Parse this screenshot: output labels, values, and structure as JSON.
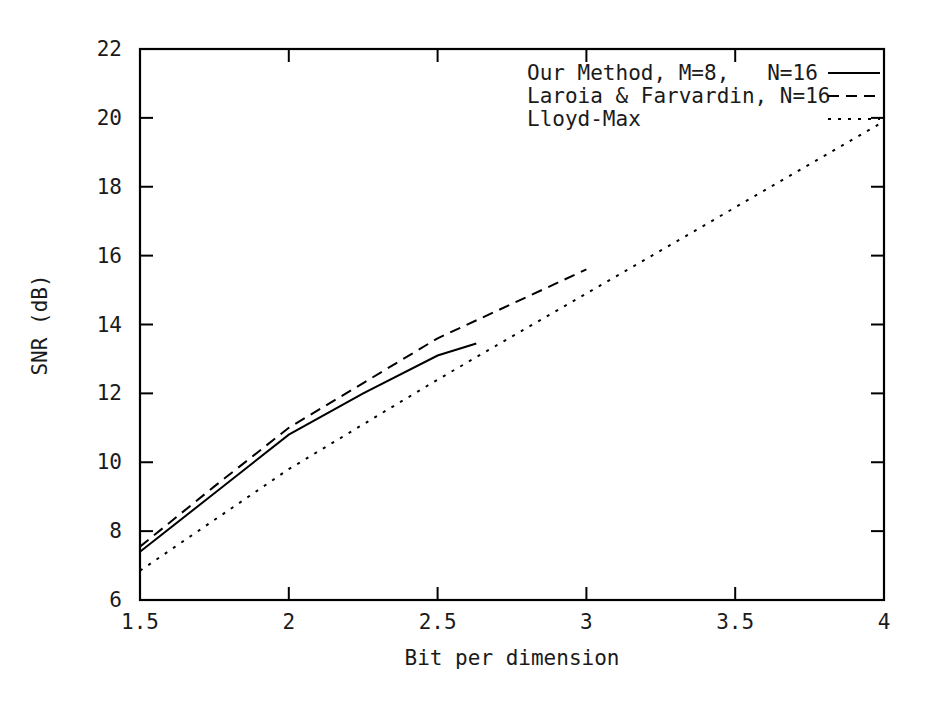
{
  "chart_data": {
    "type": "line",
    "title": "",
    "xlabel": "Bit per dimension",
    "ylabel": "SNR (dB)",
    "xlim": [
      1.5,
      4
    ],
    "ylim": [
      6,
      22
    ],
    "xticks": [
      "1.5",
      "2",
      "2.5",
      "3",
      "3.5",
      "4"
    ],
    "xtick_values": [
      1.5,
      2,
      2.5,
      3,
      3.5,
      4
    ],
    "yticks": [
      "6",
      "8",
      "10",
      "12",
      "14",
      "16",
      "18",
      "20",
      "22"
    ],
    "ytick_values": [
      6,
      8,
      10,
      12,
      14,
      16,
      18,
      20,
      22
    ],
    "grid": false,
    "legend_position": "top-right-inside",
    "series": [
      {
        "name": "Our Method, M=8,   N=16",
        "style": "solid",
        "x": [
          1.5,
          1.75,
          2.0,
          2.25,
          2.5,
          2.63
        ],
        "y": [
          7.4,
          9.1,
          10.8,
          12.0,
          13.1,
          13.45
        ]
      },
      {
        "name": "Laroia & Farvardin, N=16",
        "style": "dashed",
        "x": [
          1.5,
          1.75,
          2.0,
          2.25,
          2.5,
          2.75,
          3.0
        ],
        "y": [
          7.55,
          9.3,
          11.0,
          12.3,
          13.6,
          14.6,
          15.6
        ]
      },
      {
        "name": "Lloyd-Max",
        "style": "dotted",
        "x": [
          1.5,
          2.0,
          2.5,
          3.0,
          3.5,
          4.0
        ],
        "y": [
          6.85,
          9.8,
          12.4,
          14.9,
          17.4,
          19.9
        ]
      }
    ]
  },
  "legend": {
    "entries": [
      {
        "label": "Our Method, M=8,   N=16",
        "style": "solid"
      },
      {
        "label": "Laroia & Farvardin, N=16",
        "style": "dashed"
      },
      {
        "label": "Lloyd-Max",
        "style": "dotted"
      }
    ]
  },
  "axes": {
    "x_title": "Bit per dimension",
    "y_title": "SNR (dB)"
  },
  "colors": {
    "background": "#ffffff",
    "foreground": "#1a1a1a",
    "line": "#000000"
  }
}
